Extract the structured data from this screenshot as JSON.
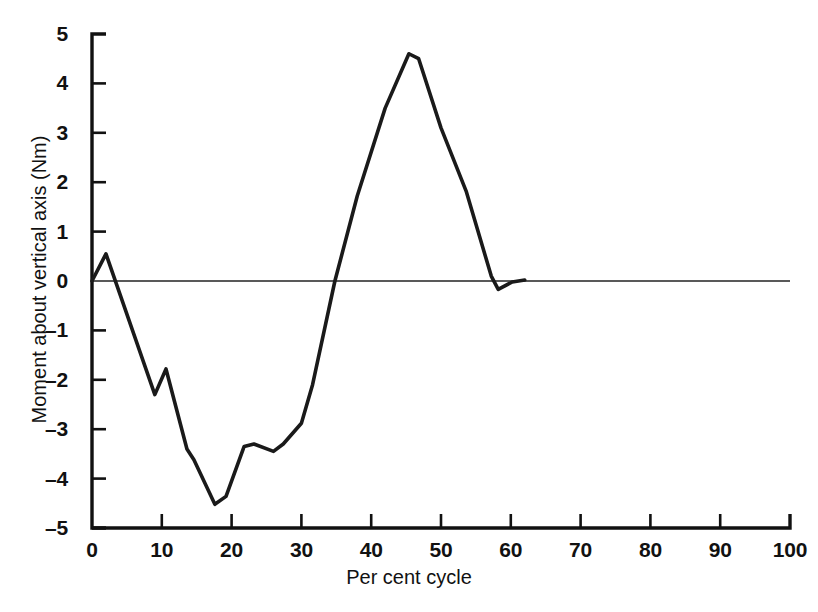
{
  "chart_data": {
    "type": "line",
    "title": "",
    "xlabel": "Per cent cycle",
    "ylabel": "Moment about vertical axis (Nm)",
    "xlim": [
      0,
      100
    ],
    "ylim": [
      -5,
      5
    ],
    "xticks": [
      0,
      10,
      20,
      30,
      40,
      50,
      60,
      70,
      80,
      90,
      100
    ],
    "xtick_labels": [
      "0",
      "10",
      "20",
      "30",
      "40",
      "50",
      "60",
      "70",
      "80",
      "90",
      "100"
    ],
    "yticks": [
      5,
      4,
      3,
      2,
      1,
      0,
      -1,
      -2,
      -3,
      -4,
      -5
    ],
    "ytick_labels": [
      "5",
      "4",
      "3",
      "2",
      "1",
      "0",
      "–1",
      "–2",
      "–3",
      "–4",
      "–5"
    ],
    "grid": false,
    "legend": null,
    "zero_reference_line": true,
    "line_color": "#1a1a1a",
    "axis_color": "#111111",
    "series": [
      {
        "name": "Moment about vertical axis",
        "x": [
          0,
          2,
          9,
          10.6,
          13.6,
          14.6,
          17.6,
          19.2,
          21.8,
          23.2,
          26,
          27.4,
          30,
          31.6,
          34.8,
          38,
          42,
          45.4,
          46.8,
          50,
          53.6,
          57.2,
          58.2,
          60.2,
          62
        ],
        "y": [
          0,
          0.55,
          -2.3,
          -1.78,
          -3.4,
          -3.62,
          -4.52,
          -4.36,
          -3.35,
          -3.3,
          -3.45,
          -3.3,
          -2.88,
          -2.1,
          0,
          1.72,
          3.5,
          4.6,
          4.5,
          3.1,
          1.82,
          0.1,
          -0.17,
          -0.02,
          0.02
        ]
      }
    ]
  },
  "axes": {
    "y_axis_name": "y-axis",
    "x_axis_name": "x-axis"
  }
}
